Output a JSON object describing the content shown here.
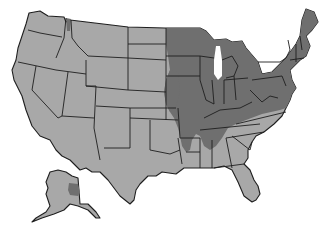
{
  "map": {
    "subject": "United States",
    "colors": {
      "background": "#ffffff",
      "low": "#a8a8a8",
      "high": "#6f6f6f",
      "border": "#1e1e1e"
    },
    "high_regions": [
      "Minnesota",
      "Iowa",
      "Missouri",
      "Wisconsin",
      "Illinois",
      "Indiana",
      "Michigan",
      "Ohio",
      "Kentucky",
      "Tennessee",
      "West Virginia",
      "Virginia",
      "Maryland",
      "Delaware",
      "Pennsylvania",
      "New York",
      "New Jersey",
      "Connecticut",
      "Rhode Island",
      "Massachusetts",
      "Vermont",
      "New Hampshire",
      "Maine",
      "eastern Kansas",
      "eastern Nebraska",
      "eastern Oklahoma",
      "Arkansas",
      "northern Mississippi",
      "northern Alabama",
      "northeast Texas",
      "Idaho panhandle",
      "interior Alaska"
    ],
    "low_regions": [
      "Washington",
      "Oregon",
      "California",
      "Nevada",
      "Idaho",
      "Montana",
      "Wyoming",
      "Utah",
      "Arizona",
      "Colorado",
      "New Mexico",
      "North Dakota",
      "South Dakota",
      "western Nebraska",
      "western Kansas",
      "Oklahoma",
      "Texas",
      "Louisiana",
      "southern Mississippi",
      "southern Alabama",
      "Georgia",
      "Florida",
      "South Carolina",
      "North Carolina",
      "Alaska"
    ]
  }
}
